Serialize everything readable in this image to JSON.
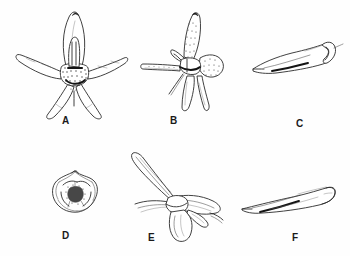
{
  "figure": {
    "kind": "botanical-line-drawing-plate",
    "background_color": "#ffffff",
    "ink_color": "#2b2b2b",
    "label_color": "#1a1a1a",
    "panel_count": 6,
    "layout": "two rows of three panels"
  },
  "panels": [
    {
      "id": "A",
      "label": "A",
      "name": "flower-front-view",
      "description": "Flower viewed from the front with spreading sepals and petals, erect dorsal sepal, central column and stippled lip base",
      "label_x": 62,
      "label_y": 116
    },
    {
      "id": "B",
      "label": "B",
      "name": "flower-lateral-view",
      "description": "Flower in oblique lateral view showing long straight spur extending to the left and pendent lateral petals",
      "label_x": 170,
      "label_y": 116
    },
    {
      "id": "C",
      "label": "C",
      "name": "lip-lateral-view",
      "description": "Lip (labellum) in lateral view, elongate and upcurved at the apex",
      "label_x": 296,
      "label_y": 119
    },
    {
      "id": "D",
      "label": "D",
      "name": "flower-bud-compact-view",
      "description": "Small compact flower or bud seen face-on with overlapping rounded segments",
      "label_x": 62,
      "label_y": 231
    },
    {
      "id": "E",
      "label": "E",
      "name": "flower-side-view-with-spur",
      "description": "Flower in side view with a long tapering curved spur directed upward and left",
      "label_x": 148,
      "label_y": 233
    },
    {
      "id": "F",
      "label": "F",
      "name": "lip-profile-view",
      "description": "Lip in profile, narrowly elongate with a slender tapering basal point",
      "label_x": 292,
      "label_y": 233
    }
  ]
}
